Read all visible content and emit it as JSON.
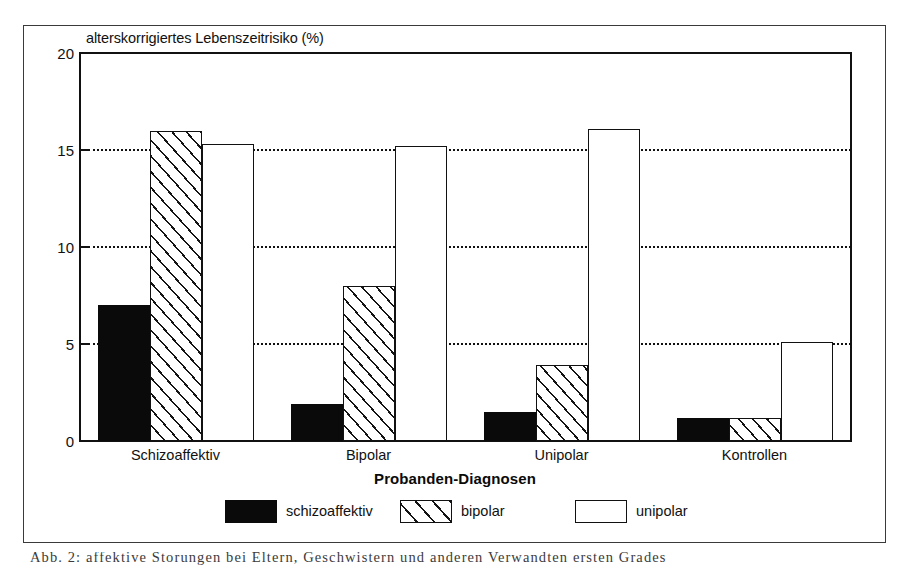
{
  "figure": {
    "title": "alterskorrigiertes Lebenszeitrisiko (%)",
    "x_axis_title": "Probanden-Diagnosen",
    "caption_fragment": "Abb. 2: affektive Storungen bei Eltern, Geschwistern und anderen Verwandten ersten Grades"
  },
  "axis": {
    "y_ticks": [
      "0",
      "5",
      "10",
      "15",
      "20"
    ],
    "group_labels": [
      "Schizoaffektiv",
      "Bipolar",
      "Unipolar",
      "Kontrollen"
    ]
  },
  "legend": {
    "items": [
      {
        "label": "schizoaffektiv",
        "style": "solid",
        "icon": "filled-square-swatch"
      },
      {
        "label": "bipolar",
        "style": "hatched",
        "icon": "hatched-square-swatch"
      },
      {
        "label": "unipolar",
        "style": "open",
        "icon": "open-square-swatch"
      }
    ]
  },
  "colors": {
    "solid_fill": "#0a0a0a",
    "outline": "#111111",
    "background": "#ffffff",
    "frame": "#3a3a3a"
  },
  "chart_data": {
    "type": "bar",
    "title": "alterskorrigiertes Lebenszeitrisiko (%)",
    "subtitle": "",
    "xlabel": "Probanden-Diagnosen",
    "ylabel": "alterskorrigiertes Lebenszeitrisiko (%)",
    "ylim": [
      0,
      20
    ],
    "yticks": [
      0,
      5,
      10,
      15,
      20
    ],
    "grid": "horizontal-dotted",
    "legend_position": "bottom-center",
    "categories": [
      "Schizoaffektiv",
      "Bipolar",
      "Unipolar",
      "Kontrollen"
    ],
    "series": [
      {
        "name": "schizoaffektiv",
        "style": "solid",
        "values": [
          7.0,
          1.9,
          1.5,
          1.2
        ]
      },
      {
        "name": "bipolar",
        "style": "hatched",
        "values": [
          16.0,
          8.0,
          3.9,
          1.2
        ]
      },
      {
        "name": "unipolar",
        "style": "open",
        "values": [
          15.3,
          15.2,
          16.1,
          5.1
        ]
      }
    ]
  }
}
